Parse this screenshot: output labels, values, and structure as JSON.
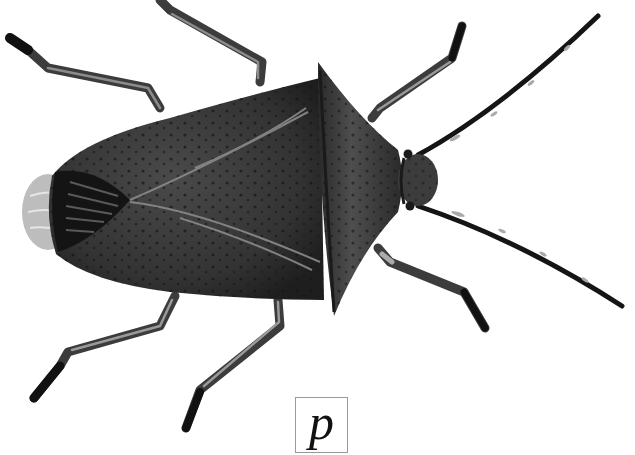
{
  "figure": {
    "label": "p",
    "colors": {
      "background": "#ffffff",
      "body": "#3a3a3a",
      "body_dark": "#1c1c1c",
      "leg": "#4a4a4a",
      "leg_highlight": "#9a9a9a",
      "membrane": "#b8b8b8",
      "label_border": "#9a9a9a"
    }
  }
}
